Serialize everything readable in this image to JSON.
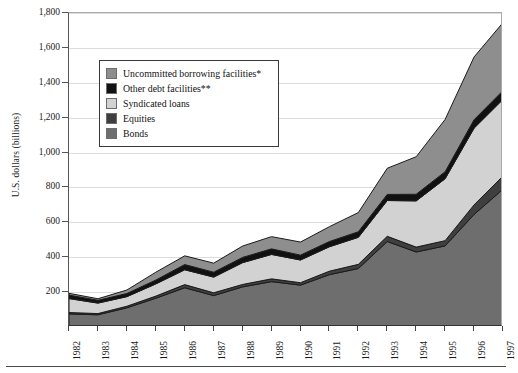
{
  "chart_data": {
    "type": "area",
    "stacked": true,
    "title": "",
    "xlabel": "",
    "ylabel": "U.S. dollars (billions)",
    "ylim": [
      0,
      1800
    ],
    "ytick_step": 200,
    "grid": true,
    "legend_position": "upper-left-inside",
    "categories": [
      "1982",
      "1983",
      "1984",
      "1985",
      "1986",
      "1987",
      "1988",
      "1989",
      "1990",
      "1991",
      "1992",
      "1993",
      "1994",
      "1995",
      "1996",
      "1997"
    ],
    "ytick_labels": [
      "0",
      "200",
      "400",
      "600",
      "800",
      "1,000",
      "1,200",
      "1,400",
      "1,600",
      "1,800"
    ],
    "ytick_values": [
      0,
      200,
      400,
      600,
      800,
      1000,
      1200,
      1400,
      1600,
      1800
    ],
    "series": [
      {
        "name": "Bonds",
        "color": "#6e6e6e",
        "order": 1,
        "values": [
          75,
          70,
          110,
          165,
          225,
          180,
          230,
          260,
          240,
          300,
          335,
          490,
          430,
          465,
          645,
          790
        ]
      },
      {
        "name": "Equities",
        "color": "#3f3f3f",
        "order": 2,
        "values": [
          8,
          7,
          9,
          12,
          18,
          16,
          14,
          16,
          14,
          20,
          24,
          30,
          28,
          30,
          55,
          75
        ]
      },
      {
        "name": "Syndicated loans",
        "color": "#d2d2d2",
        "order": 3,
        "values": [
          80,
          60,
          55,
          70,
          85,
          90,
          125,
          140,
          130,
          140,
          155,
          205,
          265,
          355,
          440,
          440
        ]
      },
      {
        "name": "Other debt facilities**",
        "color": "#111111",
        "order": 4,
        "values": [
          20,
          16,
          18,
          22,
          30,
          28,
          30,
          32,
          28,
          30,
          32,
          35,
          38,
          40,
          48,
          50
        ]
      },
      {
        "name": "Uncommitted borrowing facilities*",
        "color": "#8e8e8e",
        "order": 5,
        "values": [
          10,
          9,
          20,
          45,
          50,
          52,
          65,
          70,
          75,
          85,
          110,
          150,
          215,
          300,
          360,
          390
        ]
      }
    ],
    "stack_totals": [
      193,
      162,
      212,
      314,
      408,
      366,
      464,
      518,
      487,
      575,
      656,
      910,
      976,
      1190,
      1548,
      1745
    ]
  },
  "legend": {
    "items": [
      {
        "label": "Uncommitted borrowing facilities*",
        "color": "#8e8e8e"
      },
      {
        "label": "Other debt facilities**",
        "color": "#111111"
      },
      {
        "label": "Syndicated loans",
        "color": "#d2d2d2"
      },
      {
        "label": "Equities",
        "color": "#3f3f3f"
      },
      {
        "label": "Bonds",
        "color": "#6e6e6e"
      }
    ]
  },
  "axes": {
    "y_title": "U.S. dollars (billions)"
  }
}
